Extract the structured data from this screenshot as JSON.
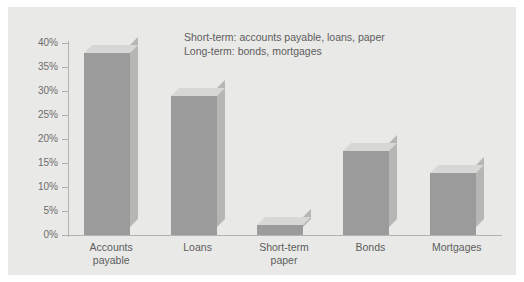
{
  "figure": {
    "background_color": "#ffffff",
    "panel_color": "#e9e9e7"
  },
  "annotation": {
    "line1": "Short-term: accounts payable, loans, paper",
    "line2": "Long-term: bonds, mortgages"
  },
  "axis": {
    "tick_labels": [
      "40%",
      "35%",
      "30%",
      "25%",
      "20%",
      "15%",
      "10%",
      "5%",
      "0%"
    ],
    "tick_values": [
      40,
      35,
      30,
      25,
      20,
      15,
      10,
      5,
      0
    ]
  },
  "chart_data": {
    "type": "bar",
    "title": "",
    "subtitle": "",
    "xlabel": "",
    "ylabel": "",
    "categories": [
      "Accounts\npayable",
      "Loans",
      "Short-term\npaper",
      "Bonds",
      "Mortgages"
    ],
    "values": [
      38,
      29,
      2,
      17.5,
      13
    ],
    "value_unit": "percent",
    "ylim": [
      0,
      40
    ],
    "ytick_step": 5,
    "ytick_labels": [
      "0%",
      "5%",
      "10%",
      "15%",
      "20%",
      "25%",
      "30%",
      "35%",
      "40%"
    ],
    "grid": false,
    "legend": "none",
    "annotations": [
      "Short-term: accounts payable, loans, paper",
      "Long-term: bonds, mortgages"
    ],
    "style": "3d-extruded",
    "colors": {
      "bar_front": "#9b9b9b",
      "bar_top": "#d7d7d5",
      "bar_side": "#b6b6b4",
      "axis": "#b3b3b1",
      "text": "#5d5d5d",
      "panel": "#e9e9e7"
    }
  }
}
